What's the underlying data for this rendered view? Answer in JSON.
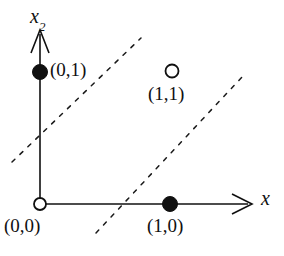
{
  "figure": {
    "background_color": "#ffffff",
    "ink_color": "#101010",
    "width": 284,
    "height": 256
  },
  "axes": {
    "x_axis": {
      "label": "x",
      "name": "horizontal-axis",
      "origin_px": [
        40,
        204
      ],
      "end_px": [
        252,
        204
      ],
      "arrow": true
    },
    "y_axis": {
      "label": "x",
      "label_subscript": "2",
      "name": "vertical-axis",
      "origin_px": [
        40,
        204
      ],
      "end_px": [
        40,
        30
      ],
      "arrow": true
    }
  },
  "points": [
    {
      "id": "point-0-0",
      "label": "(0,0)",
      "marker": "open-circle",
      "filled": false,
      "coords": [
        0,
        0
      ],
      "center_px": [
        40,
        204
      ],
      "radius_px": 6
    },
    {
      "id": "point-0-1",
      "label": "(0,1)",
      "marker": "filled-circle",
      "filled": true,
      "coords": [
        0,
        1
      ],
      "center_px": [
        40,
        72
      ],
      "radius_px": 7
    },
    {
      "id": "point-1-0",
      "label": "(1,0)",
      "marker": "filled-circle",
      "filled": true,
      "coords": [
        1,
        0
      ],
      "center_px": [
        170,
        204
      ],
      "radius_px": 7
    },
    {
      "id": "point-1-1",
      "label": "(1,1)",
      "marker": "open-circle",
      "filled": false,
      "coords": [
        1,
        1
      ],
      "center_px": [
        172,
        71
      ],
      "radius_px": 6.5
    }
  ],
  "dashed_lines": [
    {
      "id": "decision-boundary-lower",
      "start_px": [
        12,
        162
      ],
      "end_px": [
        141,
        38
      ],
      "style": "dashed"
    },
    {
      "id": "decision-boundary-upper",
      "start_px": [
        96,
        233
      ],
      "end_px": [
        243,
        76
      ],
      "style": "dashed"
    }
  ]
}
